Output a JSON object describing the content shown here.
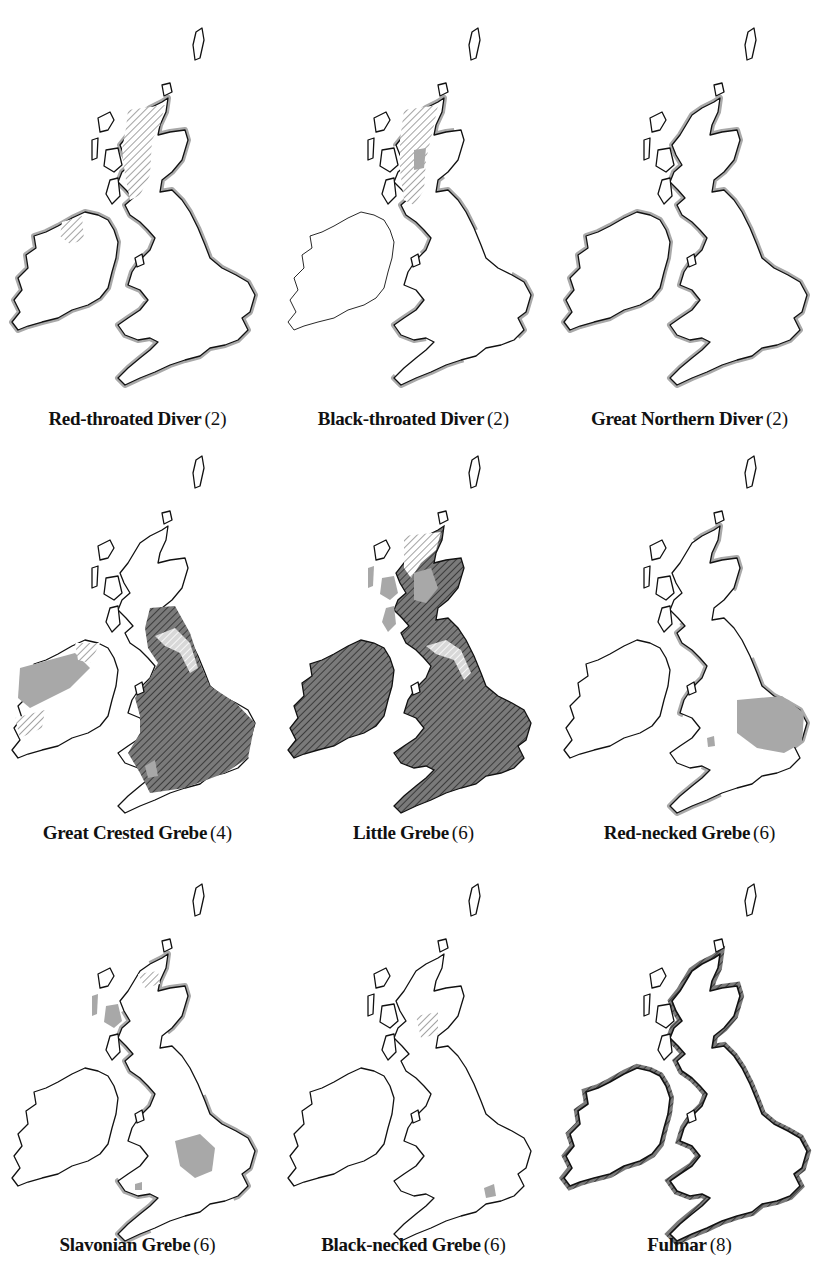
{
  "figure": {
    "type": "distribution-map-grid",
    "layout": {
      "rows": 3,
      "columns": 3
    },
    "legend_hints": {
      "dark_hatch_on_grey": "breeding + wintering",
      "light_hatch": "breeding range",
      "grey_fill": "wintering / non-breeding range",
      "grey_coastal_band": "coastal occurrence"
    },
    "colors": {
      "outline": "#111111",
      "grey_fill": "#a8a8a8",
      "dark_hatch_bg": "#6e6e6e",
      "background": "#ffffff"
    }
  },
  "maps": [
    {
      "name": "Red-throated Diver",
      "code": "(2)",
      "pattern": "north-scotland-hatch-coastal-grey"
    },
    {
      "name": "Black-throated Diver",
      "code": "(2)",
      "pattern": "highland-hatch-partial-coast"
    },
    {
      "name": "Great Northern Diver",
      "code": "(2)",
      "pattern": "coastal-grey"
    },
    {
      "name": "Great Crested Grebe",
      "code": "(4)",
      "pattern": "widespread-england-ireland"
    },
    {
      "name": "Little Grebe",
      "code": "(6)",
      "pattern": "widespread-all"
    },
    {
      "name": "Red-necked Grebe",
      "code": "(6)",
      "pattern": "east-anglia-grey"
    },
    {
      "name": "Slavonian Grebe",
      "code": "(6)",
      "pattern": "highland-hatch-midlands-grey"
    },
    {
      "name": "Black-necked Grebe",
      "code": "(6)",
      "pattern": "central-scotland-hatch-small-grey"
    },
    {
      "name": "Fulmar",
      "code": "(8)",
      "pattern": "coastal-hatch"
    }
  ]
}
